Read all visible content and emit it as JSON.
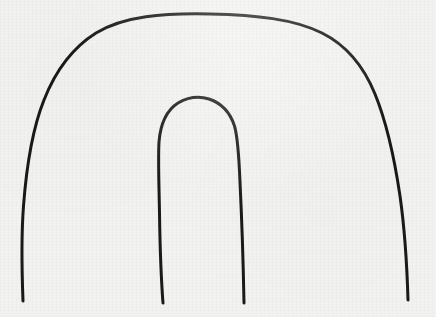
{
  "image": {
    "kind": "scanned-line-drawing",
    "title": "Nested arch outline sketch",
    "width": 436,
    "height": 317,
    "background_color": "#f2f2f0",
    "texture": "faint scanned paper noise"
  },
  "drawing": {
    "style": {
      "stroke_color": "#1a1a1a",
      "stroke_width": 3,
      "line_cap": "round",
      "line_join": "round",
      "fill": "none"
    },
    "description": "Hand drawn horseshoe shaped arch: one large outer arch with two open legs running down to near the bottom edge, and a smaller narrow arch nested inside it with its own two open legs ending at the same baseline.",
    "strokes": [
      {
        "name": "outer-arch",
        "role": "large outer horseshoe arch with open legs",
        "start_point": [
          23,
          301
        ],
        "end_point": [
          408,
          300
        ],
        "apex_point": [
          210,
          15
        ],
        "path": "M 23 301 C 21.5 262 21.2 236 23.5 206 C 26.5 166 32 130 44 100 C 55 72 72 48 96 33 C 124 16 163 13 210 14 C 256 15 294 19 322 33 C 348 46 364 67 375 94 C 386 121 394 155 400 196 C 405 231 407 266 408 300"
      },
      {
        "name": "inner-arch",
        "role": "small inner arch with open legs",
        "start_point": [
          163,
          303
        ],
        "end_point": [
          244,
          303
        ],
        "apex_point": [
          203,
          100
        ],
        "path": "M 163 303 C 161 277 160 247 159.5 213 C 159 184 158 160 159 142 C 160.5 123 167 110 178 103 C 188.5 97 199 96 209 99 C 221 103 230 112 234.5 126 C 238 138 239 157 240 182 C 241.5 213 243 250 244 303"
      }
    ]
  }
}
